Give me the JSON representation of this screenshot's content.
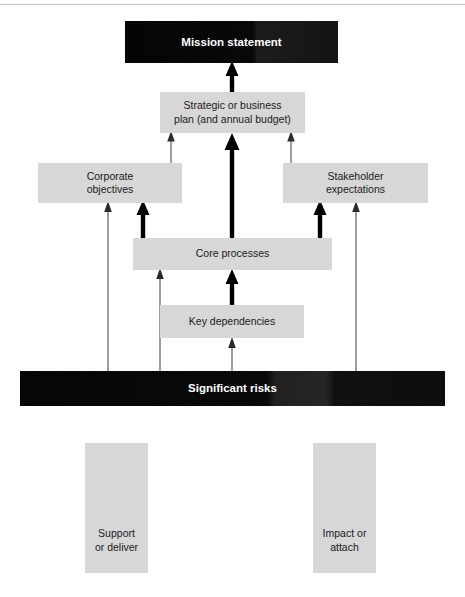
{
  "diagram": {
    "title_present": false,
    "background_color": "#ffffff",
    "node_fill_grey": "#d7d7d7",
    "node_fill_dark": "#0a0a0a",
    "node_text_dark": "#1a1a1a",
    "node_text_light": "#ffffff",
    "arrow_color": "#000000",
    "nodes": [
      {
        "id": "mission-statement",
        "label": "Mission statement",
        "style": "dark"
      },
      {
        "id": "strategic-plan",
        "label": "Strategic or business\nplan (and annual budget)",
        "style": "grey"
      },
      {
        "id": "corporate-objectives",
        "label": "Corporate\nobjectives",
        "style": "grey"
      },
      {
        "id": "stakeholder-expectations",
        "label": "Stakeholder\nexpectations",
        "style": "grey"
      },
      {
        "id": "core-processes",
        "label": "Core processes",
        "style": "grey"
      },
      {
        "id": "key-dependencies",
        "label": "Key dependencies",
        "style": "grey"
      },
      {
        "id": "significant-risks",
        "label": "Significant risks",
        "style": "dark"
      }
    ],
    "legend": [
      {
        "id": "legend-support",
        "label": "Support\nor deliver",
        "arrow": "thick-up-arrow"
      },
      {
        "id": "legend-impact",
        "label": "Impact or\nattach",
        "arrow": "thin-up-arrow"
      }
    ],
    "relations": [
      {
        "from": "strategic-plan",
        "to": "mission-statement",
        "type": "support-or-deliver"
      },
      {
        "from": "core-processes",
        "to": "strategic-plan",
        "type": "support-or-deliver"
      },
      {
        "from": "core-processes",
        "to": "corporate-objectives",
        "type": "support-or-deliver"
      },
      {
        "from": "core-processes",
        "to": "stakeholder-expectations",
        "type": "support-or-deliver"
      },
      {
        "from": "key-dependencies",
        "to": "core-processes",
        "type": "support-or-deliver"
      },
      {
        "from": "corporate-objectives",
        "to": "strategic-plan",
        "type": "impact-or-attach"
      },
      {
        "from": "stakeholder-expectations",
        "to": "strategic-plan",
        "type": "impact-or-attach"
      },
      {
        "from": "significant-risks",
        "to": "corporate-objectives",
        "type": "impact-or-attach"
      },
      {
        "from": "significant-risks",
        "to": "core-processes",
        "type": "impact-or-attach"
      },
      {
        "from": "significant-risks",
        "to": "key-dependencies",
        "type": "impact-or-attach"
      },
      {
        "from": "significant-risks",
        "to": "stakeholder-expectations",
        "type": "impact-or-attach"
      }
    ]
  }
}
